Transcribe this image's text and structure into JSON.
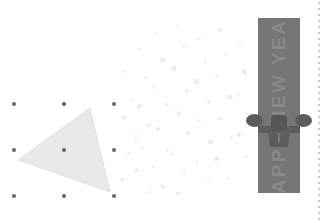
{
  "canvas": {
    "width": 326,
    "height": 223,
    "background_color": "#ffffff",
    "description": "Slide editing canvas"
  },
  "selected_shape": {
    "name": "triangle",
    "fill_color": "#e9e9e9",
    "stroke_color": "#e2e2e2",
    "points": "18,160 90,108 110,192",
    "selection": {
      "handle_color": "#3a3a3a",
      "bounding_box": {
        "x": 14,
        "y": 104,
        "width": 100,
        "height": 92
      },
      "handles": [
        {
          "name": "handle-top-left",
          "x": 14,
          "y": 104
        },
        {
          "name": "handle-top-center",
          "x": 64,
          "y": 104
        },
        {
          "name": "handle-top-right",
          "x": 114,
          "y": 104
        },
        {
          "name": "handle-middle-left",
          "x": 14,
          "y": 150
        },
        {
          "name": "handle-middle-center",
          "x": 64,
          "y": 150
        },
        {
          "name": "handle-middle-right",
          "x": 114,
          "y": 150
        },
        {
          "name": "handle-bottom-left",
          "x": 14,
          "y": 196
        },
        {
          "name": "handle-bottom-center",
          "x": 64,
          "y": 196
        },
        {
          "name": "handle-bottom-right",
          "x": 114,
          "y": 196
        }
      ]
    }
  },
  "confetti": {
    "color": "#ededed",
    "pieces": [
      {
        "x": 123,
        "y": 69,
        "w": 5,
        "h": 4,
        "r": 28
      },
      {
        "x": 129,
        "y": 98,
        "w": 4,
        "h": 4,
        "r": -14
      },
      {
        "x": 121,
        "y": 116,
        "w": 5,
        "h": 3,
        "r": 40
      },
      {
        "x": 134,
        "y": 133,
        "w": 4,
        "h": 5,
        "r": 12
      },
      {
        "x": 126,
        "y": 152,
        "w": 5,
        "h": 4,
        "r": -33
      },
      {
        "x": 120,
        "y": 178,
        "w": 4,
        "h": 3,
        "r": 20
      },
      {
        "x": 138,
        "y": 47,
        "w": 4,
        "h": 4,
        "r": 55
      },
      {
        "x": 143,
        "y": 76,
        "w": 5,
        "h": 4,
        "r": -22
      },
      {
        "x": 137,
        "y": 104,
        "w": 4,
        "h": 5,
        "r": 33
      },
      {
        "x": 146,
        "y": 123,
        "w": 6,
        "h": 4,
        "r": -8
      },
      {
        "x": 140,
        "y": 146,
        "w": 4,
        "h": 4,
        "r": 44
      },
      {
        "x": 134,
        "y": 169,
        "w": 5,
        "h": 3,
        "r": -30
      },
      {
        "x": 148,
        "y": 190,
        "w": 4,
        "h": 4,
        "r": 16
      },
      {
        "x": 155,
        "y": 32,
        "w": 4,
        "h": 4,
        "r": -45
      },
      {
        "x": 160,
        "y": 58,
        "w": 5,
        "h": 4,
        "r": 25
      },
      {
        "x": 152,
        "y": 84,
        "w": 4,
        "h": 5,
        "r": -18
      },
      {
        "x": 163,
        "y": 102,
        "w": 6,
        "h": 5,
        "r": 38
      },
      {
        "x": 156,
        "y": 127,
        "w": 4,
        "h": 4,
        "r": -52
      },
      {
        "x": 165,
        "y": 148,
        "w": 5,
        "h": 4,
        "r": 10
      },
      {
        "x": 151,
        "y": 165,
        "w": 4,
        "h": 4,
        "r": -26
      },
      {
        "x": 160,
        "y": 185,
        "w": 5,
        "h": 3,
        "r": 47
      },
      {
        "x": 176,
        "y": 24,
        "w": 4,
        "h": 4,
        "r": 19
      },
      {
        "x": 181,
        "y": 45,
        "w": 5,
        "h": 4,
        "r": -37
      },
      {
        "x": 172,
        "y": 66,
        "w": 4,
        "h": 5,
        "r": 29
      },
      {
        "x": 184,
        "y": 88,
        "w": 5,
        "h": 4,
        "r": -11
      },
      {
        "x": 175,
        "y": 111,
        "w": 6,
        "h": 5,
        "r": 42
      },
      {
        "x": 186,
        "y": 131,
        "w": 4,
        "h": 4,
        "r": -21
      },
      {
        "x": 170,
        "y": 152,
        "w": 5,
        "h": 4,
        "r": 34
      },
      {
        "x": 182,
        "y": 172,
        "w": 4,
        "h": 4,
        "r": -48
      },
      {
        "x": 176,
        "y": 192,
        "w": 5,
        "h": 3,
        "r": 15
      },
      {
        "x": 196,
        "y": 36,
        "w": 5,
        "h": 4,
        "r": -31
      },
      {
        "x": 203,
        "y": 60,
        "w": 4,
        "h": 4,
        "r": 23
      },
      {
        "x": 194,
        "y": 79,
        "w": 5,
        "h": 5,
        "r": -15
      },
      {
        "x": 206,
        "y": 99,
        "w": 6,
        "h": 4,
        "r": 50
      },
      {
        "x": 197,
        "y": 119,
        "w": 4,
        "h": 4,
        "r": -39
      },
      {
        "x": 208,
        "y": 140,
        "w": 5,
        "h": 4,
        "r": 17
      },
      {
        "x": 195,
        "y": 160,
        "w": 4,
        "h": 4,
        "r": -27
      },
      {
        "x": 205,
        "y": 180,
        "w": 5,
        "h": 3,
        "r": 36
      },
      {
        "x": 218,
        "y": 28,
        "w": 4,
        "h": 4,
        "r": -20
      },
      {
        "x": 224,
        "y": 52,
        "w": 5,
        "h": 4,
        "r": 31
      },
      {
        "x": 215,
        "y": 74,
        "w": 4,
        "h": 5,
        "r": -43
      },
      {
        "x": 227,
        "y": 95,
        "w": 5,
        "h": 4,
        "r": 13
      },
      {
        "x": 217,
        "y": 116,
        "w": 6,
        "h": 4,
        "r": -34
      },
      {
        "x": 229,
        "y": 136,
        "w": 4,
        "h": 4,
        "r": 46
      },
      {
        "x": 214,
        "y": 157,
        "w": 5,
        "h": 4,
        "r": -9
      },
      {
        "x": 226,
        "y": 176,
        "w": 4,
        "h": 3,
        "r": 27
      },
      {
        "x": 238,
        "y": 42,
        "w": 4,
        "h": 4,
        "r": -25
      },
      {
        "x": 242,
        "y": 70,
        "w": 5,
        "h": 4,
        "r": 39
      },
      {
        "x": 236,
        "y": 92,
        "w": 4,
        "h": 5,
        "r": -17
      },
      {
        "x": 245,
        "y": 112,
        "w": 5,
        "h": 4,
        "r": 21
      },
      {
        "x": 237,
        "y": 133,
        "w": 4,
        "h": 4,
        "r": -41
      },
      {
        "x": 244,
        "y": 155,
        "w": 5,
        "h": 3,
        "r": 18
      }
    ]
  },
  "gift_banner": {
    "name": "happy-new-year-banner",
    "box_color": "#767676",
    "ribbon_color": "#5d5d5d",
    "knot_color": "#565656",
    "text": "HAPPY NEW YEAR",
    "text_color": "#8d8d8d",
    "text_orientation": "vertical-rotated-90",
    "position": {
      "x": 258,
      "y": 18,
      "width": 42,
      "height": 175
    }
  },
  "margin_guide": {
    "name": "right-margin-guide",
    "x": 318,
    "color": "#c9c9c9",
    "style": "dotted",
    "dot_spacing": 6
  }
}
